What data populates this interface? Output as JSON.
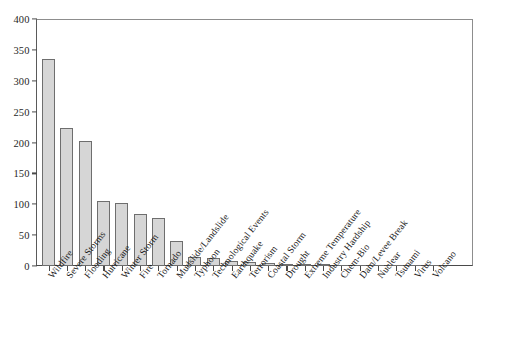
{
  "chart_data": {
    "type": "bar",
    "title": "",
    "xlabel": "",
    "ylabel": "",
    "ylim": [
      0,
      400
    ],
    "ytick_step": 50,
    "yticks": [
      0,
      50,
      100,
      150,
      200,
      250,
      300,
      350,
      400
    ],
    "grid": false,
    "legend": "none",
    "bar_fill_color": "#d6d6d6",
    "bar_edge_color": "#6e6e6e",
    "axis_color": "#4a4a4a",
    "categories": [
      "Wildfire",
      "Severe Storms",
      "Flooding",
      "Hurricane",
      "Winter Storm",
      "Fire",
      "Tornado",
      "Mudslide/Landslide",
      "Typhoon",
      "Technological Events",
      "Earthquake",
      "Terrorism",
      "Coastal Storm",
      "Drought",
      "Extreme Temperature",
      "Industry Hardship",
      "Chem-Bio",
      "Dam/Levee Break",
      "Nuclear",
      "Tsunami",
      "Virus",
      "Volcano"
    ],
    "values": [
      336,
      224,
      202,
      105,
      102,
      85,
      78,
      41,
      15,
      13,
      8,
      6,
      5,
      3,
      3,
      3,
      1,
      1,
      0,
      0,
      0,
      0
    ]
  }
}
